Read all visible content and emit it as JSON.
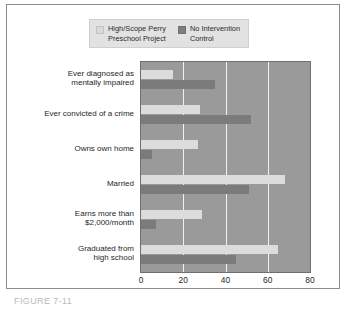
{
  "legend": {
    "entries": [
      {
        "label": "High/Scope Perry\nPreschool Project",
        "swatch": "light-gray-swatch",
        "color": "#d9d9d9"
      },
      {
        "label": "No Intervention\nControl",
        "swatch": "dark-gray-swatch",
        "color": "#7e7e7e"
      }
    ]
  },
  "axis": {
    "ticks": [
      "0",
      "20",
      "40",
      "60",
      "80"
    ]
  },
  "caption": {
    "text": "FIGURE 7-11"
  },
  "chart_data": {
    "type": "bar",
    "orientation": "horizontal",
    "title": "",
    "xlabel": "",
    "ylabel": "",
    "xlim": [
      0,
      80
    ],
    "xticks": [
      0,
      20,
      40,
      60,
      80
    ],
    "grid": true,
    "gridlines_at": [
      20,
      40,
      60
    ],
    "legend_position": "top",
    "categories": [
      "Ever diagnosed as\nmentally impaired",
      "Ever convicted of a crime",
      "Owns own home",
      "Married",
      "Earns more than\n$2,000/month",
      "Graduated from\nhigh school"
    ],
    "series": [
      {
        "name": "High/Scope Perry Preschool Project",
        "color": "#dcdcdc",
        "values": [
          15,
          28,
          27,
          68,
          29,
          65
        ]
      },
      {
        "name": "No Intervention Control",
        "color": "#7b7b7b",
        "values": [
          35,
          52,
          5,
          51,
          7,
          45
        ]
      }
    ]
  }
}
